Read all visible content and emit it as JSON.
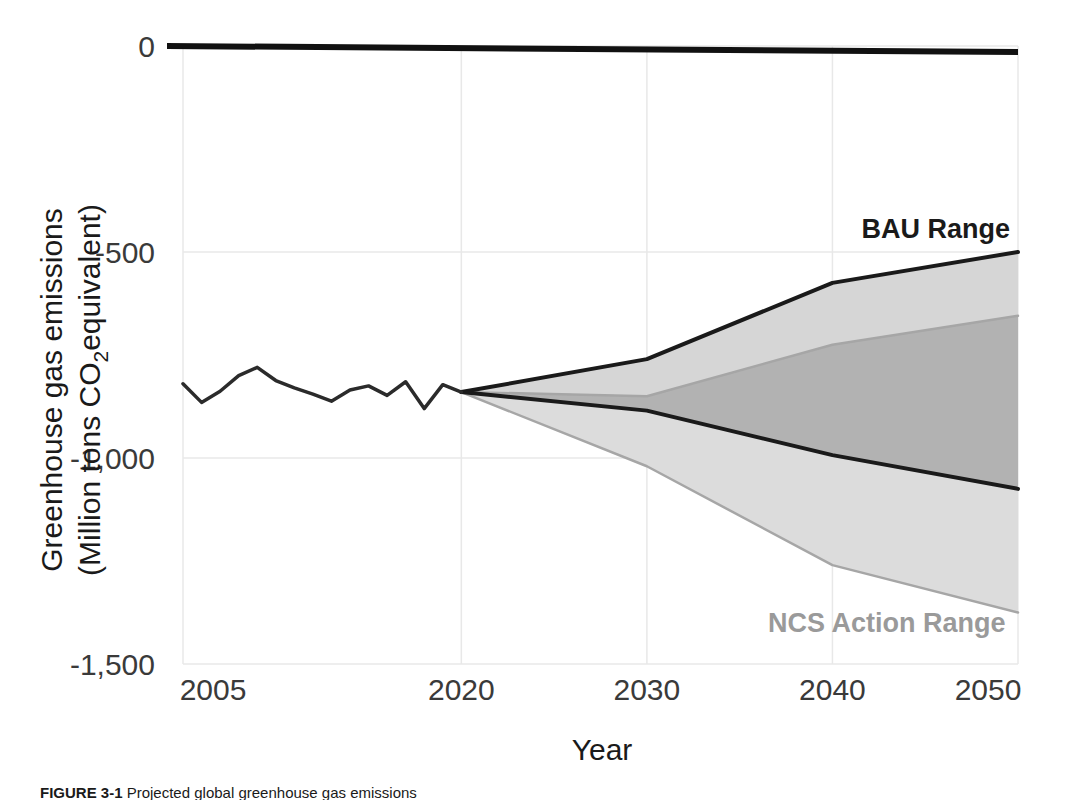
{
  "figure": {
    "caption_label": "FIGURE 3-1",
    "caption_text": " Projected global greenhouse gas emissions"
  },
  "chart_data": {
    "type": "area",
    "title": "",
    "xlabel": "Year",
    "ylabel_line1": "Greenhouse gas emissions",
    "ylabel_line2_pre": "(Million tons CO",
    "ylabel_line2_sub": "2",
    "ylabel_line2_post": "equivalent)",
    "xlim": [
      2005,
      2050
    ],
    "ylim": [
      -1500,
      0
    ],
    "xticks": [
      2005,
      2020,
      2030,
      2040,
      2050
    ],
    "xtick_labels": [
      "2005",
      "2020",
      "2030",
      "2040",
      "2050"
    ],
    "yticks": [
      0,
      -500,
      -1000,
      -1500
    ],
    "ytick_labels": [
      "0",
      "-500",
      "-1,000",
      "-1,500"
    ],
    "grid": true,
    "legend_position": "inline-annotation",
    "zero_reference_line": 0,
    "colors": {
      "bau_band": "#d6d6d6",
      "ncs_band": "#dcdcdc",
      "overlap_band": "#b2b2b2",
      "bau_line": "#1a1a1a",
      "ncs_line": "#a6a6a6",
      "historical_line": "#2b2b2b",
      "grid_line": "#e8e8e8",
      "zero_line": "#111111"
    },
    "series": [
      {
        "name": "Historical emissions",
        "type": "line",
        "x": [
          2005,
          2006,
          2007,
          2008,
          2009,
          2010,
          2011,
          2012,
          2013,
          2014,
          2015,
          2016,
          2017,
          2018,
          2019,
          2020
        ],
        "values": [
          -820,
          -865,
          -838,
          -800,
          -780,
          -812,
          -830,
          -845,
          -862,
          -835,
          -825,
          -848,
          -815,
          -880,
          -822,
          -840
        ]
      },
      {
        "name": "BAU Range",
        "type": "band",
        "label": "BAU Range",
        "x": [
          2020,
          2030,
          2040,
          2050
        ],
        "upper": [
          -840,
          -760,
          -575,
          -500
        ],
        "lower": [
          -840,
          -885,
          -993,
          -1075
        ]
      },
      {
        "name": "NCS Action Range",
        "type": "band",
        "label": "NCS Action Range",
        "x": [
          2020,
          2030,
          2040,
          2050
        ],
        "upper": [
          -840,
          -850,
          -725,
          -655
        ],
        "lower": [
          -840,
          -1020,
          -1260,
          -1375
        ]
      }
    ],
    "annotations": [
      {
        "text": "BAU Range",
        "x": 2046,
        "y": -455
      },
      {
        "text": "NCS Action Range",
        "x": 2036,
        "y": -1405
      }
    ]
  }
}
